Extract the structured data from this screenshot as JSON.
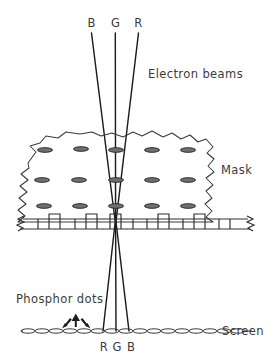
{
  "diagram": {
    "colors": {
      "ink": "#2b2b2b",
      "beam": "#1d1d1d",
      "text": "#3b3b3b",
      "hole_fill": "#6f6f6f",
      "background": "#ffffff"
    },
    "labels": {
      "beam_b_top": "B",
      "beam_g_top": "G",
      "beam_r_top": "R",
      "electron_beams": "Electron beams",
      "mask": "Mask",
      "phosphor_dots": "Phosphor dots",
      "screen": "Screen",
      "dot_r_bottom": "R",
      "dot_g_bottom": "G",
      "dot_b_bottom": "B"
    },
    "icons": {
      "arrow_left": "arrow-up-left-icon",
      "arrow_up": "arrow-up-icon",
      "arrow_right": "arrow-up-right-icon"
    },
    "geometry": {
      "width": 276,
      "height": 363,
      "beams": [
        {
          "name": "B",
          "top_x": 91,
          "top_y": 33,
          "converge_x": 115.5,
          "converge_y": 222,
          "screen_x": 103,
          "screen_y": 331
        },
        {
          "name": "G",
          "top_x": 115,
          "top_y": 33,
          "converge_x": 115.5,
          "converge_y": 222,
          "screen_x": 116,
          "screen_y": 331
        },
        {
          "name": "R",
          "top_x": 138,
          "top_y": 33,
          "converge_x": 115.5,
          "converge_y": 222,
          "screen_x": 129,
          "screen_y": 331
        }
      ],
      "mask_hole_rows_y": [
        150,
        180,
        206
      ],
      "mask_hole_cols_x": [
        45,
        81,
        116,
        152,
        188
      ],
      "mask_section_y": 222,
      "screen_y": 331,
      "screen_x_start": 23,
      "screen_x_end": 248
    }
  }
}
